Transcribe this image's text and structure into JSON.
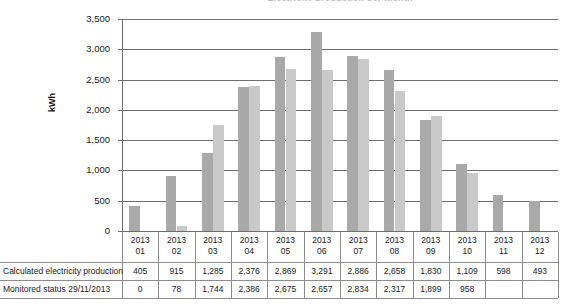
{
  "chart_data": {
    "type": "bar",
    "title": "Electricity production per month",
    "xlabel": "",
    "ylabel": "kWh",
    "ylim": [
      0,
      3500
    ],
    "yticks": [
      "0",
      "500",
      "1,000",
      "1,500",
      "2,000",
      "2,500",
      "3,000",
      "3,500"
    ],
    "ytick_values": [
      0,
      500,
      1000,
      1500,
      2000,
      2500,
      3000,
      3500
    ],
    "grid": true,
    "legend": "none",
    "categories": [
      "2013\n01",
      "2013\n02",
      "2013\n03",
      "2013\n04",
      "2013\n05",
      "2013\n06",
      "2013\n07",
      "2013\n08",
      "2013\n09",
      "2013\n10",
      "2013\n11",
      "2013\n12"
    ],
    "category_years": [
      "2013",
      "2013",
      "2013",
      "2013",
      "2013",
      "2013",
      "2013",
      "2013",
      "2013",
      "2013",
      "2013",
      "2013"
    ],
    "category_months": [
      "01",
      "02",
      "03",
      "04",
      "05",
      "06",
      "07",
      "08",
      "09",
      "10",
      "11",
      "12"
    ],
    "series": [
      {
        "name": "Calculated electricity production",
        "color": "#a9a9a9",
        "values": [
          405,
          915,
          1285,
          2376,
          2869,
          3291,
          2886,
          2658,
          1830,
          1109,
          598,
          493
        ],
        "labels": [
          "405",
          "915",
          "1,285",
          "2,376",
          "2,869",
          "3,291",
          "2,886",
          "2,658",
          "1,830",
          "1,109",
          "598",
          "493"
        ]
      },
      {
        "name": "Monitored status 29/11/2013",
        "color": "#c9c9c9",
        "values": [
          0,
          78,
          1744,
          2386,
          2675,
          2657,
          2834,
          2317,
          1899,
          958,
          null,
          null
        ],
        "labels": [
          "0",
          "78",
          "1,744",
          "2,386",
          "2,675",
          "2,657",
          "2,834",
          "2,317",
          "1,899",
          "958",
          "",
          ""
        ]
      }
    ]
  },
  "table": {
    "row_labels": [
      "Calculated electricity production",
      "Monitored status 29/11/2013"
    ],
    "header_year": "2013",
    "rows": [
      [
        "405",
        "915",
        "1,285",
        "2,376",
        "2,869",
        "3,291",
        "2,886",
        "2,658",
        "1,830",
        "1,109",
        "598",
        "493"
      ],
      [
        "0",
        "78",
        "1,744",
        "2,386",
        "2,675",
        "2,657",
        "2,834",
        "2,317",
        "1,899",
        "958",
        "",
        ""
      ]
    ]
  }
}
